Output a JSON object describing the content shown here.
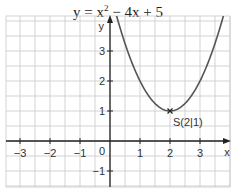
{
  "chart_data": {
    "type": "line",
    "title_parts": {
      "lhs": "y = x",
      "exp": "2",
      "rhs": " − 4x + 5"
    },
    "xlabel": "x",
    "ylabel": "y",
    "function": "x^2 - 4x + 5",
    "xlim": [
      -3.5,
      3.9
    ],
    "ylim": [
      -1.5,
      4.2
    ],
    "grid": true,
    "grid_step": 0.5,
    "x_ticks": [
      -3,
      -2,
      -1,
      1,
      2,
      3
    ],
    "x_tick_labels": [
      "−3",
      "−2",
      "−1",
      "1",
      "2",
      "3"
    ],
    "y_ticks": [
      -1,
      1,
      2,
      3
    ],
    "y_tick_labels": [
      "−1",
      "1",
      "2",
      "3"
    ],
    "origin_label": "0",
    "series": [
      {
        "name": "y = x² − 4x + 5",
        "x": [
          0.0,
          0.5,
          1.0,
          1.5,
          2.0,
          2.5,
          3.0,
          3.5,
          4.0
        ],
        "values": [
          5.0,
          3.25,
          2.0,
          1.25,
          1.0,
          1.25,
          2.0,
          3.25,
          5.0
        ]
      }
    ],
    "annotations": [
      {
        "text": "S(2|1)",
        "x": 2,
        "y": 1,
        "marker": "x"
      }
    ],
    "colors": {
      "grid": "#c8c8c8",
      "axis": "#222222",
      "curve": "#555555"
    }
  }
}
